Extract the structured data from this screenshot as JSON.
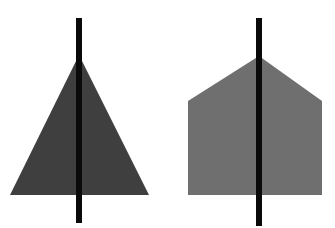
{
  "canvas": {
    "width": 335,
    "height": 228,
    "background_color": "#ffffff",
    "title": "Two shaded shapes each bisected by a vertical black line"
  },
  "chart_data": {
    "type": "scatter",
    "xlabel": "",
    "ylabel": "",
    "xlim": [
      0,
      335
    ],
    "ylim": [
      0,
      228
    ],
    "grid": false,
    "legend": "none",
    "annotations": [],
    "figures": [
      {
        "name": "dark-triangle",
        "shape": "triangle",
        "fill_color": "#3f3f3f",
        "vertices": [
          [
            79,
            55
          ],
          [
            10,
            195
          ],
          [
            149,
            195
          ]
        ],
        "apex": [
          79,
          55
        ],
        "base_y": 195,
        "base_left_x": 10,
        "base_right_x": 149,
        "width": 139,
        "height": 140
      },
      {
        "name": "gray-pentagon",
        "shape": "pentagon-house",
        "fill_color": "#6f6f6f",
        "vertices": [
          [
            259,
            56
          ],
          [
            322,
            101
          ],
          [
            322,
            195
          ],
          [
            188,
            195
          ],
          [
            188,
            101
          ]
        ],
        "apex": [
          259,
          56
        ],
        "shoulder_y": 101,
        "base_y": 195,
        "left_x": 188,
        "right_x": 322,
        "width": 134,
        "height": 139
      }
    ],
    "lines": [
      {
        "name": "left-bisecting-line",
        "color": "#0a0a0a",
        "x": 79,
        "y_top": 18,
        "y_bottom": 223,
        "thickness": 6,
        "orientation": "vertical"
      },
      {
        "name": "right-bisecting-line",
        "color": "#0a0a0a",
        "x": 259,
        "y_top": 18,
        "y_bottom": 226,
        "thickness": 6,
        "orientation": "vertical"
      }
    ]
  }
}
